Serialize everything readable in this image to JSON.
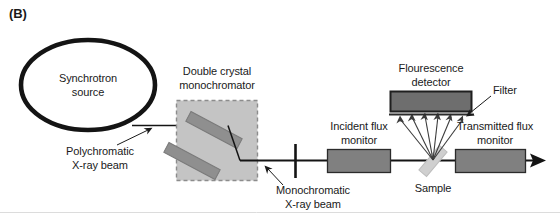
{
  "figure": {
    "panel_label": "(B)",
    "background_color": "#ffffff",
    "width": 560,
    "height": 218
  },
  "palette": {
    "outline": "#1a1a1a",
    "beam_line": "#111111",
    "component_fill": "#808080",
    "component_stroke": "#2b2b2b",
    "monochromator_fill": "#c4c4c4",
    "monochromator_border": "#8c8c8c",
    "crystal_fill": "#8f8f8f",
    "sample_fill": "#cfcfcf",
    "text": "#1a1a1a",
    "footer_rule": "#d9d9d9"
  },
  "components": {
    "source": {
      "name": "Synchrotron source",
      "label_line1": "Synchrotron",
      "label_line2": "source",
      "shape": "ellipse",
      "stroke_width": 4.5
    },
    "monochromator": {
      "label_line1": "Double crystal",
      "label_line2": "monochromator",
      "border_style": "dashed",
      "crystal_count": 2
    },
    "slit": {
      "name": "slit",
      "label": ""
    },
    "incident_monitor": {
      "label_line1": "Incident flux",
      "label_line2": "monitor"
    },
    "fluorescence_detector": {
      "label_line1": "Flourescence",
      "label_line2": "detector"
    },
    "filter": {
      "label": "Filter"
    },
    "sample": {
      "label": "Sample",
      "fluorescence_ray_count": 6
    },
    "transmitted_monitor": {
      "label_line1": "Transmitted flux",
      "label_line2": "monitor"
    }
  },
  "beams": {
    "polychromatic": {
      "label_line1": "Polychromatic",
      "label_line2": "X-ray beam"
    },
    "monochromatic": {
      "label_line1": "Monochromatic",
      "label_line2": "X-ray beam"
    }
  }
}
